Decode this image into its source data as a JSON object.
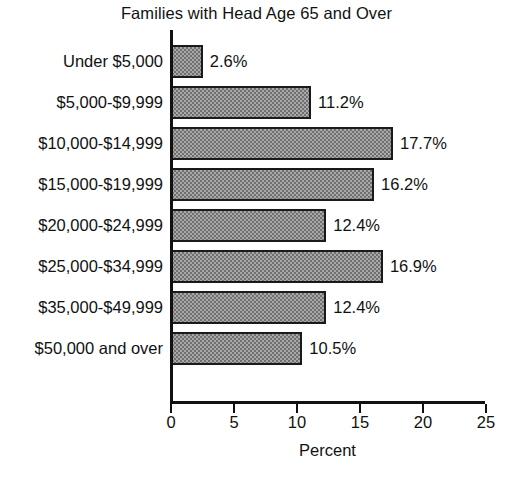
{
  "chart_data": {
    "type": "bar",
    "orientation": "horizontal",
    "title": "Families with Head Age 65 and Over",
    "xlabel": "Percent",
    "ylabel": "",
    "xlim": [
      0,
      25
    ],
    "xticks": [
      0,
      5,
      10,
      15,
      20,
      25
    ],
    "xtick_labels": [
      "0",
      "5",
      "10",
      "15",
      "20",
      "25"
    ],
    "grid": false,
    "legend": null,
    "categories": [
      "Under $5,000",
      "$5,000-$9,999",
      "$10,000-$14,999",
      "$15,000-$19,999",
      "$20,000-$24,999",
      "$25,000-$34,999",
      "$35,000-$49,999",
      "$50,000 and over"
    ],
    "values": [
      2.6,
      11.2,
      17.7,
      16.2,
      12.4,
      16.9,
      12.4,
      10.5
    ],
    "value_labels": [
      "2.6%",
      "11.2%",
      "17.7%",
      "16.2%",
      "12.4%",
      "16.9%",
      "12.4%",
      "10.5%"
    ],
    "bars": [
      {
        "category": "Under $5,000",
        "value": 2.6,
        "label": "2.6%"
      },
      {
        "category": "$5,000-$9,999",
        "value": 11.2,
        "label": "11.2%"
      },
      {
        "category": "$10,000-$14,999",
        "value": 17.7,
        "label": "17.7%"
      },
      {
        "category": "$15,000-$19,999",
        "value": 16.2,
        "label": "16.2%"
      },
      {
        "category": "$20,000-$24,999",
        "value": 12.4,
        "label": "12.4%"
      },
      {
        "category": "$25,000-$34,999",
        "value": 16.9,
        "label": "16.9%"
      },
      {
        "category": "$35,000-$49,999",
        "value": 12.4,
        "label": "12.4%"
      },
      {
        "category": "$50,000 and over",
        "value": 10.5,
        "label": "10.5%"
      }
    ],
    "colors": {
      "bar_fill": "#a8a8a8",
      "bar_pattern": "#707070",
      "bar_border": "#1a1a1a",
      "axis": "#111111",
      "text": "#111111",
      "background": "#ffffff"
    }
  }
}
